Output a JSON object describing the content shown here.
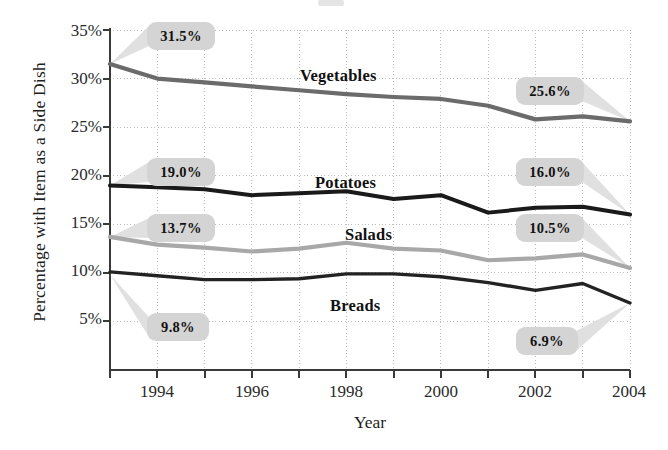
{
  "chart_data": {
    "type": "line",
    "title": "",
    "xlabel": "Year",
    "ylabel": "Percentage with Item as a Side Dish",
    "x": [
      1993,
      1994,
      1995,
      1996,
      1997,
      1998,
      1999,
      2000,
      2001,
      2002,
      2003,
      2004
    ],
    "xticks": [
      "1994",
      "1996",
      "1998",
      "2000",
      "2002",
      "2004"
    ],
    "xlim": [
      1993,
      2004
    ],
    "ylim": [
      0,
      35
    ],
    "yticks": [
      "5%",
      "10%",
      "15%",
      "20%",
      "25%",
      "30%",
      "35%"
    ],
    "ytick_values": [
      5,
      10,
      15,
      20,
      25,
      30,
      35
    ],
    "grid": true,
    "legend": "inline-series-labels",
    "series": [
      {
        "name": "Vegetables",
        "color": "#6b6b6b",
        "values": [
          31.5,
          30.0,
          29.6,
          29.2,
          28.8,
          28.4,
          28.1,
          27.9,
          27.2,
          25.8,
          26.1,
          25.6
        ]
      },
      {
        "name": "Potatoes",
        "color": "#1a1a1a",
        "values": [
          19.0,
          18.8,
          18.6,
          18.0,
          18.2,
          18.4,
          17.6,
          18.0,
          16.2,
          16.7,
          16.8,
          16.0
        ]
      },
      {
        "name": "Salads",
        "color": "#a8a8a8",
        "values": [
          13.7,
          12.9,
          12.6,
          12.2,
          12.5,
          13.1,
          12.5,
          12.3,
          11.3,
          11.5,
          11.9,
          10.5
        ]
      },
      {
        "name": "Breads",
        "color": "#232323",
        "values": [
          10.1,
          9.7,
          9.3,
          9.3,
          9.4,
          9.9,
          9.9,
          9.6,
          9.0,
          8.2,
          8.9,
          6.9
        ]
      }
    ],
    "callouts": [
      {
        "label": "31.5%",
        "series": "Vegetables",
        "year": 1993,
        "value": 31.5,
        "side": "left"
      },
      {
        "label": "25.6%",
        "series": "Vegetables",
        "year": 2004,
        "value": 25.6,
        "side": "right"
      },
      {
        "label": "19.0%",
        "series": "Potatoes",
        "year": 1993,
        "value": 19.0,
        "side": "left"
      },
      {
        "label": "16.0%",
        "series": "Potatoes",
        "year": 2004,
        "value": 16.0,
        "side": "right"
      },
      {
        "label": "13.7%",
        "series": "Salads",
        "year": 1993,
        "value": 13.7,
        "side": "left"
      },
      {
        "label": "10.5%",
        "series": "Salads",
        "year": 2004,
        "value": 10.5,
        "side": "right"
      },
      {
        "label": "9.8%",
        "series": "Breads",
        "year": 1993,
        "value": 9.8,
        "side": "left"
      },
      {
        "label": "6.9%",
        "series": "Breads",
        "year": 2004,
        "value": 6.9,
        "side": "right"
      }
    ]
  },
  "axis": {
    "y_title": "Percentage with Item as a Side Dish",
    "x_title": "Year",
    "y_labels": [
      "35%",
      "30%",
      "25%",
      "20%",
      "15%",
      "10%",
      "5%"
    ],
    "x_labels": [
      "1994",
      "1996",
      "1998",
      "2000",
      "2002",
      "2004"
    ]
  },
  "series_labels": {
    "vegetables": "Vegetables",
    "potatoes": "Potatoes",
    "salads": "Salads",
    "breads": "Breads"
  },
  "callout_labels": {
    "veg_left": "31.5%",
    "veg_right": "25.6%",
    "pot_left": "19.0%",
    "pot_right": "16.0%",
    "sal_left": "13.7%",
    "sal_right": "10.5%",
    "bre_left": "9.8%",
    "bre_right": "6.9%"
  },
  "colors": {
    "vegetables": "#6b6b6b",
    "potatoes": "#1a1a1a",
    "salads": "#a8a8a8",
    "breads": "#232323",
    "callout_bg": "#d4d4d4",
    "grid": "#bdbdbd",
    "axis": "#3a3a3a"
  }
}
